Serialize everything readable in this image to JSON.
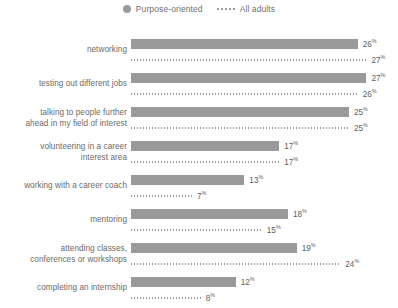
{
  "legend": {
    "entries": [
      {
        "label": "Purpose-oriented",
        "marker": "filled-circle",
        "color": "#9a9a9a"
      },
      {
        "label": "All adults",
        "marker": "dotted-line",
        "color": "#9a9a9a"
      }
    ]
  },
  "chart_data": {
    "type": "bar",
    "orientation": "horizontal",
    "title": "",
    "subtitle": "",
    "xlabel": "",
    "ylabel": "",
    "xlim": [
      0,
      30
    ],
    "grid": false,
    "legend_position": "top-center",
    "value_suffix": "%",
    "bar_color": "#9a9a9a",
    "dotted_color": "#9a9a9a",
    "categories": [
      "networking",
      "testing out different jobs",
      "talking to people further\nahead in my field of interest",
      "volunteering in a career\ninterest area",
      "working with a career coach",
      "mentoring",
      "attending classes,\nconferences or workshops",
      "completing an internship"
    ],
    "series": [
      {
        "name": "Purpose-oriented",
        "style": "bar",
        "values": [
          26,
          27,
          25,
          17,
          13,
          18,
          19,
          12
        ],
        "labels": [
          "26",
          "27",
          "25",
          "17",
          "13",
          "18",
          "19",
          "12"
        ]
      },
      {
        "name": "All adults",
        "style": "dotted",
        "values": [
          27,
          26,
          25,
          17,
          7,
          15,
          24,
          8
        ],
        "labels": [
          "27",
          "26",
          "25",
          "17",
          "7",
          "15",
          "24",
          "8"
        ]
      }
    ]
  }
}
